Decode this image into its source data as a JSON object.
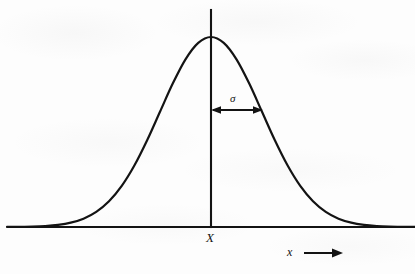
{
  "figure": {
    "background_color": "#fdfdfd",
    "ink_color": "#131313"
  },
  "labels": {
    "mean_label": "X",
    "x_axis_label": "x",
    "sigma_label": "σ"
  },
  "icons": {
    "x_axis_direction_arrow": "arrow-right-icon",
    "sigma_span_arrow": "double-headed-arrow-icon"
  },
  "chart_data": {
    "type": "line",
    "xlabel": "x",
    "ylabel": "",
    "grid": false,
    "legend": false,
    "annotations": [
      {
        "name": "mean-axis",
        "label": "X",
        "kind": "vertical-line",
        "x": 0.0,
        "description": "Vertical axis through the mean of the distribution"
      },
      {
        "name": "sigma-span",
        "label": "σ",
        "kind": "double-headed-arrow",
        "x_start": 0.0,
        "x_end": 1.0,
        "y": 0.607,
        "description": "One standard deviation to the right of the mean"
      },
      {
        "name": "x-axis-direction",
        "label": "x",
        "kind": "arrow-right",
        "description": "Direction of increasing x along the horizontal axis"
      }
    ],
    "curve": {
      "name": "gaussian",
      "mean": 0.0,
      "sigma": 1.0,
      "xlim": [
        -4.0,
        4.0
      ],
      "ylim": [
        0.0,
        1.0
      ],
      "x": [
        -4.0,
        -3.75,
        -3.5,
        -3.25,
        -3.0,
        -2.75,
        -2.5,
        -2.25,
        -2.0,
        -1.75,
        -1.5,
        -1.25,
        -1.0,
        -0.75,
        -0.5,
        -0.25,
        0.0,
        0.25,
        0.5,
        0.75,
        1.0,
        1.25,
        1.5,
        1.75,
        2.0,
        2.25,
        2.5,
        2.75,
        3.0,
        3.25,
        3.5,
        3.75,
        4.0
      ],
      "y": [
        0.0003,
        0.0009,
        0.0022,
        0.0051,
        0.0111,
        0.0228,
        0.0439,
        0.0796,
        0.1353,
        0.2163,
        0.3247,
        0.4578,
        0.6065,
        0.7548,
        0.8825,
        0.9692,
        1.0,
        0.9692,
        0.8825,
        0.7548,
        0.6065,
        0.4578,
        0.3247,
        0.2163,
        0.1353,
        0.0796,
        0.0439,
        0.0228,
        0.0111,
        0.0051,
        0.0022,
        0.0009,
        0.0003
      ]
    }
  }
}
